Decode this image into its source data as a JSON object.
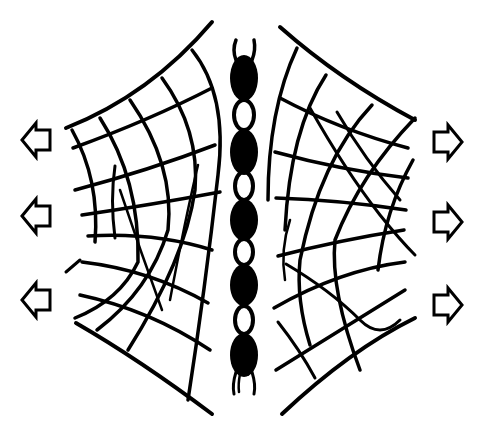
{
  "diagram": {
    "colors": {
      "ink": "#000000",
      "background": "#ffffff"
    },
    "left_arrows": [
      {
        "direction": "left",
        "cx": 38,
        "cy": 140
      },
      {
        "direction": "left",
        "cx": 38,
        "cy": 216
      },
      {
        "direction": "left",
        "cx": 38,
        "cy": 300
      }
    ],
    "right_arrows": [
      {
        "direction": "right",
        "cx": 446,
        "cy": 142
      },
      {
        "direction": "right",
        "cx": 446,
        "cy": 222
      },
      {
        "direction": "right",
        "cx": 446,
        "cy": 305
      }
    ],
    "chain": {
      "center_x": 244,
      "black_segments": [
        {
          "cy": 78,
          "rx": 14,
          "ry": 23
        },
        {
          "cy": 152,
          "rx": 14,
          "ry": 23
        },
        {
          "cy": 220,
          "rx": 14,
          "ry": 21
        },
        {
          "cy": 285,
          "rx": 14,
          "ry": 21
        },
        {
          "cy": 355,
          "rx": 14,
          "ry": 22
        }
      ],
      "white_links": [
        {
          "cy": 115,
          "rx": 10,
          "ry": 15
        },
        {
          "cy": 186,
          "rx": 9,
          "ry": 14
        },
        {
          "cy": 252,
          "rx": 9,
          "ry": 13
        },
        {
          "cy": 320,
          "rx": 9,
          "ry": 14
        }
      ]
    },
    "left_mesh": "web",
    "right_mesh": "web"
  }
}
